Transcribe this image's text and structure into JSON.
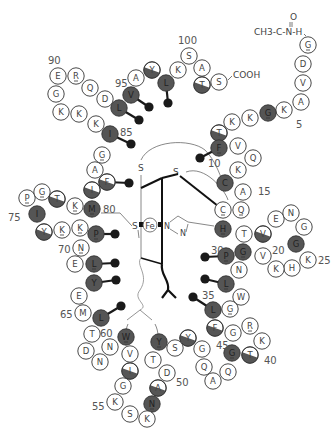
{
  "n_terminus": {
    "label": "CH3-C-N-H",
    "carbonyl": "O"
  },
  "c_terminus": {
    "label": "COOH"
  },
  "heme": {
    "iron_label": "Fe",
    "sulfur_label": "S",
    "histidine_n1": "N",
    "histidine_n2": "N"
  },
  "colors": {
    "invariant": "#555555",
    "partial": "#555555",
    "variable": "#ffffff",
    "outline": "#333333",
    "sidechain": "#1a1a1a"
  },
  "residues": [
    {
      "n": 1,
      "aa": "G",
      "x": 308,
      "y": 45,
      "fill": "w",
      "u": true
    },
    {
      "n": 2,
      "aa": "D",
      "x": 303,
      "y": 64,
      "fill": "w"
    },
    {
      "n": 3,
      "aa": "V",
      "x": 303,
      "y": 83,
      "fill": "w"
    },
    {
      "n": 4,
      "aa": "A",
      "x": 301,
      "y": 102,
      "fill": "w"
    },
    {
      "n": 5,
      "aa": "K",
      "x": 284,
      "y": 110,
      "fill": "w"
    },
    {
      "n": 6,
      "aa": "G",
      "x": 268,
      "y": 113,
      "fill": "d",
      "u": true
    },
    {
      "n": 7,
      "aa": "K",
      "x": 250,
      "y": 118,
      "fill": "w"
    },
    {
      "n": 8,
      "aa": "K",
      "x": 232,
      "y": 122,
      "fill": "w"
    },
    {
      "n": 9,
      "aa": "T",
      "x": 219,
      "y": 133,
      "fill": "h"
    },
    {
      "n": 10,
      "aa": "F",
      "x": 219,
      "y": 148,
      "fill": "d",
      "u": true,
      "sc": [
        200,
        158
      ]
    },
    {
      "n": 11,
      "aa": "V",
      "x": 238,
      "y": 146,
      "fill": "w"
    },
    {
      "n": 12,
      "aa": "Q",
      "x": 253,
      "y": 158,
      "fill": "w"
    },
    {
      "n": 13,
      "aa": "K",
      "x": 238,
      "y": 170,
      "fill": "w"
    },
    {
      "n": 14,
      "aa": "C",
      "x": 225,
      "y": 183,
      "fill": "d"
    },
    {
      "n": 15,
      "aa": "A",
      "x": 243,
      "y": 192,
      "fill": "w"
    },
    {
      "n": 16,
      "aa": "Q",
      "x": 241,
      "y": 210,
      "fill": "w",
      "u": true
    },
    {
      "n": 17,
      "aa": "C",
      "x": 223,
      "y": 210,
      "fill": "w",
      "u": true
    },
    {
      "n": 18,
      "aa": "H",
      "x": 223,
      "y": 229,
      "fill": "d",
      "u": true
    },
    {
      "n": 19,
      "aa": "T",
      "x": 244,
      "y": 234,
      "fill": "w"
    },
    {
      "n": 20,
      "aa": "V",
      "x": 263,
      "y": 234,
      "fill": "h"
    },
    {
      "n": 21,
      "aa": "E",
      "x": 276,
      "y": 219,
      "fill": "w"
    },
    {
      "n": 22,
      "aa": "N",
      "x": 291,
      "y": 213,
      "fill": "w"
    },
    {
      "n": 23,
      "aa": "G",
      "x": 304,
      "y": 227,
      "fill": "w"
    },
    {
      "n": 24,
      "aa": "G",
      "x": 296,
      "y": 244,
      "fill": "d"
    },
    {
      "n": 25,
      "aa": "K",
      "x": 308,
      "y": 260,
      "fill": "w"
    },
    {
      "n": 26,
      "aa": "H",
      "x": 292,
      "y": 268,
      "fill": "w"
    },
    {
      "n": 27,
      "aa": "K",
      "x": 276,
      "y": 269,
      "fill": "w"
    },
    {
      "n": 28,
      "aa": "V",
      "x": 263,
      "y": 256,
      "fill": "w"
    },
    {
      "n": 29,
      "aa": "G",
      "x": 243,
      "y": 252,
      "fill": "d",
      "u": true
    },
    {
      "n": 30,
      "aa": "P",
      "x": 226,
      "y": 256,
      "fill": "d",
      "u": true,
      "sc": [
        205,
        257
      ]
    },
    {
      "n": 31,
      "aa": "N",
      "x": 239,
      "y": 270,
      "fill": "w"
    },
    {
      "n": 32,
      "aa": "L",
      "x": 226,
      "y": 284,
      "fill": "d",
      "u": true,
      "sc": [
        205,
        279
      ]
    },
    {
      "n": 33,
      "aa": "W",
      "x": 241,
      "y": 297,
      "fill": "w"
    },
    {
      "n": 34,
      "aa": "G",
      "x": 230,
      "y": 309,
      "fill": "w",
      "u": true
    },
    {
      "n": 35,
      "aa": "L",
      "x": 213,
      "y": 310,
      "fill": "d",
      "sc": [
        193,
        297
      ]
    },
    {
      "n": 36,
      "aa": "F",
      "x": 215,
      "y": 328,
      "fill": "h"
    },
    {
      "n": 37,
      "aa": "G",
      "x": 233,
      "y": 333,
      "fill": "w"
    },
    {
      "n": 38,
      "aa": "R",
      "x": 250,
      "y": 326,
      "fill": "w",
      "u": true
    },
    {
      "n": 39,
      "aa": "K",
      "x": 262,
      "y": 341,
      "fill": "w"
    },
    {
      "n": 40,
      "aa": "T",
      "x": 250,
      "y": 355,
      "fill": "h"
    },
    {
      "n": 41,
      "aa": "G",
      "x": 232,
      "y": 353,
      "fill": "d",
      "u": true
    },
    {
      "n": 42,
      "aa": "Q",
      "x": 228,
      "y": 372,
      "fill": "w"
    },
    {
      "n": 43,
      "aa": "A",
      "x": 213,
      "y": 381,
      "fill": "w"
    },
    {
      "n": 44,
      "aa": "Q",
      "x": 204,
      "y": 367,
      "fill": "w"
    },
    {
      "n": 45,
      "aa": "G",
      "x": 202,
      "y": 349,
      "fill": "w"
    },
    {
      "n": 46,
      "aa": "Y",
      "x": 188,
      "y": 338,
      "fill": "h"
    },
    {
      "n": 47,
      "aa": "S",
      "x": 175,
      "y": 348,
      "fill": "w"
    },
    {
      "n": 48,
      "aa": "Y",
      "x": 159,
      "y": 342,
      "fill": "d",
      "u": true
    },
    {
      "n": 49,
      "aa": "T",
      "x": 153,
      "y": 360,
      "fill": "w"
    },
    {
      "n": 50,
      "aa": "D",
      "x": 167,
      "y": 373,
      "fill": "w"
    },
    {
      "n": 51,
      "aa": "A",
      "x": 158,
      "y": 388,
      "fill": "h"
    },
    {
      "n": 52,
      "aa": "N",
      "x": 152,
      "y": 404,
      "fill": "d",
      "u": true
    },
    {
      "n": 53,
      "aa": "K",
      "x": 147,
      "y": 419,
      "fill": "w"
    },
    {
      "n": 54,
      "aa": "S",
      "x": 130,
      "y": 414,
      "fill": "w"
    },
    {
      "n": 55,
      "aa": "K",
      "x": 115,
      "y": 402,
      "fill": "w"
    },
    {
      "n": 56,
      "aa": "G",
      "x": 123,
      "y": 386,
      "fill": "w"
    },
    {
      "n": 57,
      "aa": "I",
      "x": 130,
      "y": 371,
      "fill": "h"
    },
    {
      "n": 58,
      "aa": "V",
      "x": 130,
      "y": 354,
      "fill": "w"
    },
    {
      "n": 59,
      "aa": "W",
      "x": 126,
      "y": 337,
      "fill": "d",
      "u": true
    },
    {
      "n": 60,
      "aa": "N",
      "x": 110,
      "y": 347,
      "fill": "w"
    },
    {
      "n": 61,
      "aa": "N",
      "x": 100,
      "y": 362,
      "fill": "w"
    },
    {
      "n": 62,
      "aa": "D",
      "x": 86,
      "y": 351,
      "fill": "w"
    },
    {
      "n": 63,
      "aa": "T",
      "x": 92,
      "y": 334,
      "fill": "w"
    },
    {
      "n": 64,
      "aa": "L",
      "x": 101,
      "y": 318,
      "fill": "d",
      "sc": [
        121,
        306
      ]
    },
    {
      "n": 65,
      "aa": "M",
      "x": 83,
      "y": 313,
      "fill": "w"
    },
    {
      "n": 66,
      "aa": "E",
      "x": 79,
      "y": 296,
      "fill": "w"
    },
    {
      "n": 67,
      "aa": "Y",
      "x": 94,
      "y": 283,
      "fill": "d",
      "sc": [
        116,
        280
      ]
    },
    {
      "n": 68,
      "aa": "L",
      "x": 94,
      "y": 264,
      "fill": "d",
      "u": true,
      "sc": [
        115,
        263
      ]
    },
    {
      "n": 69,
      "aa": "E",
      "x": 75,
      "y": 264,
      "fill": "w"
    },
    {
      "n": 70,
      "aa": "N",
      "x": 81,
      "y": 248,
      "fill": "w",
      "u": true
    },
    {
      "n": 71,
      "aa": "P",
      "x": 96,
      "y": 234,
      "fill": "d",
      "u": true,
      "sc": [
        115,
        234
      ]
    },
    {
      "n": 72,
      "aa": "K",
      "x": 80,
      "y": 228,
      "fill": "w",
      "u": true
    },
    {
      "n": 73,
      "aa": "K",
      "x": 62,
      "y": 230,
      "fill": "w",
      "u": true
    },
    {
      "n": 74,
      "aa": "Y",
      "x": 44,
      "y": 232,
      "fill": "h"
    },
    {
      "n": 75,
      "aa": "I",
      "x": 37,
      "y": 214,
      "fill": "d"
    },
    {
      "n": 76,
      "aa": "P",
      "x": 27,
      "y": 198,
      "fill": "w",
      "u": true
    },
    {
      "n": 77,
      "aa": "G",
      "x": 42,
      "y": 192,
      "fill": "w",
      "u": true
    },
    {
      "n": 78,
      "aa": "T",
      "x": 57,
      "y": 199,
      "fill": "h"
    },
    {
      "n": 79,
      "aa": "K",
      "x": 75,
      "y": 206,
      "fill": "w",
      "u": true
    },
    {
      "n": 80,
      "aa": "M",
      "x": 92,
      "y": 209,
      "fill": "d",
      "u": true
    },
    {
      "n": 81,
      "aa": "I",
      "x": 92,
      "y": 190,
      "fill": "h"
    },
    {
      "n": 82,
      "aa": "F",
      "x": 107,
      "y": 182,
      "fill": "h",
      "sc": [
        129,
        183
      ]
    },
    {
      "n": 83,
      "aa": "A",
      "x": 95,
      "y": 170,
      "fill": "w"
    },
    {
      "n": 84,
      "aa": "G",
      "x": 102,
      "y": 155,
      "fill": "w",
      "u": true
    },
    {
      "n": 85,
      "aa": "I",
      "x": 110,
      "y": 134,
      "fill": "d",
      "sc": [
        131,
        144
      ]
    },
    {
      "n": 86,
      "aa": "K",
      "x": 96,
      "y": 124,
      "fill": "w"
    },
    {
      "n": 87,
      "aa": "K",
      "x": 79,
      "y": 114,
      "fill": "w"
    },
    {
      "n": 88,
      "aa": "K",
      "x": 61,
      "y": 112,
      "fill": "w"
    },
    {
      "n": 89,
      "aa": "G",
      "x": 56,
      "y": 94,
      "fill": "w"
    },
    {
      "n": 90,
      "aa": "E",
      "x": 58,
      "y": 76,
      "fill": "w"
    },
    {
      "n": 91,
      "aa": "R",
      "x": 76,
      "y": 76,
      "fill": "w",
      "u": true
    },
    {
      "n": 92,
      "aa": "Q",
      "x": 90,
      "y": 88,
      "fill": "w"
    },
    {
      "n": 93,
      "aa": "D",
      "x": 105,
      "y": 99,
      "fill": "w"
    },
    {
      "n": 94,
      "aa": "L",
      "x": 119,
      "y": 108,
      "fill": "d",
      "sc": [
        139,
        120
      ]
    },
    {
      "n": 95,
      "aa": "V",
      "x": 131,
      "y": 95,
      "fill": "d",
      "sc": [
        149,
        107
      ]
    },
    {
      "n": 96,
      "aa": "A",
      "x": 136,
      "y": 78,
      "fill": "w"
    },
    {
      "n": 97,
      "aa": "Y",
      "x": 152,
      "y": 70,
      "fill": "h"
    },
    {
      "n": 98,
      "aa": "L",
      "x": 166,
      "y": 83,
      "fill": "d",
      "sc": [
        168,
        103
      ]
    },
    {
      "n": 99,
      "aa": "K",
      "x": 178,
      "y": 70,
      "fill": "w"
    },
    {
      "n": 100,
      "aa": "S",
      "x": 189,
      "y": 56,
      "fill": "w"
    },
    {
      "n": 101,
      "aa": "A",
      "x": 202,
      "y": 68,
      "fill": "w"
    },
    {
      "n": 102,
      "aa": "T",
      "x": 202,
      "y": 85,
      "fill": "h"
    },
    {
      "n": 103,
      "aa": "S",
      "x": 219,
      "y": 82,
      "fill": "w"
    }
  ],
  "position_labels": [
    {
      "text": "5",
      "x": 296,
      "y": 128
    },
    {
      "text": "10",
      "x": 208,
      "y": 167
    },
    {
      "text": "15",
      "x": 258,
      "y": 195
    },
    {
      "text": "20",
      "x": 272,
      "y": 254
    },
    {
      "text": "25",
      "x": 318,
      "y": 264
    },
    {
      "text": "30",
      "x": 211,
      "y": 254
    },
    {
      "text": "35",
      "x": 202,
      "y": 299
    },
    {
      "text": "40",
      "x": 264,
      "y": 364
    },
    {
      "text": "45",
      "x": 216,
      "y": 349
    },
    {
      "text": "50",
      "x": 176,
      "y": 386
    },
    {
      "text": "55",
      "x": 92,
      "y": 410
    },
    {
      "text": "60",
      "x": 100,
      "y": 337
    },
    {
      "text": "65",
      "x": 60,
      "y": 318
    },
    {
      "text": "70",
      "x": 58,
      "y": 253
    },
    {
      "text": "75",
      "x": 8,
      "y": 221
    },
    {
      "text": "80",
      "x": 103,
      "y": 213
    },
    {
      "text": "85",
      "x": 120,
      "y": 136
    },
    {
      "text": "90",
      "x": 48,
      "y": 64
    },
    {
      "text": "95",
      "x": 115,
      "y": 87
    },
    {
      "text": "100",
      "x": 178,
      "y": 44
    }
  ]
}
